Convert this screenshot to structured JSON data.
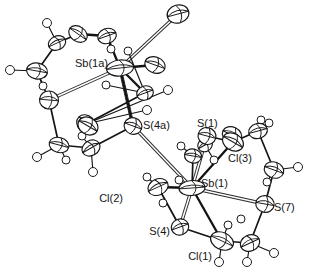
{
  "figure": {
    "kind": "ortep-thermal-ellipsoid-plot",
    "background_color": "#ffffff",
    "line_color": "#141414",
    "label_color": "#151515",
    "width": 312,
    "height": 279
  },
  "labels": [
    {
      "id": "sb1a",
      "text": "Sb(1a)",
      "x": 75,
      "y": 67,
      "anchor": "start"
    },
    {
      "id": "s4a",
      "text": "S(4a)",
      "x": 143,
      "y": 129,
      "anchor": "start"
    },
    {
      "id": "s1",
      "text": "S(1)",
      "x": 197,
      "y": 127,
      "anchor": "start"
    },
    {
      "id": "cl3",
      "text": "Cl(3)",
      "x": 228,
      "y": 162,
      "anchor": "start"
    },
    {
      "id": "sb1",
      "text": "Sb(1)",
      "x": 201,
      "y": 187,
      "anchor": "start"
    },
    {
      "id": "s7",
      "text": "S(7)",
      "x": 274,
      "y": 211,
      "anchor": "start"
    },
    {
      "id": "cl2",
      "text": "Cl(2)",
      "x": 123,
      "y": 202,
      "anchor": "end"
    },
    {
      "id": "s4",
      "text": "S(4)",
      "x": 170,
      "y": 235,
      "anchor": "end"
    },
    {
      "id": "cl1",
      "text": "Cl(1)",
      "x": 212,
      "y": 260,
      "anchor": "end"
    }
  ],
  "atoms": {
    "heavy": [
      {
        "id": "Sb1a",
        "element": "Sb",
        "x": 120,
        "y": 68,
        "rx": 13.5,
        "ry": 8.0,
        "rot": -6,
        "style": "ellipsoid"
      },
      {
        "id": "Sb1",
        "element": "Sb",
        "x": 192,
        "y": 188,
        "rx": 13.0,
        "ry": 7.5,
        "rot": -4,
        "style": "ellipsoid"
      },
      {
        "id": "S4a",
        "element": "S",
        "x": 133,
        "y": 126,
        "rx": 9.0,
        "ry": 8.2,
        "rot": 20,
        "style": "ellipsoid"
      },
      {
        "id": "S1",
        "element": "S",
        "x": 207,
        "y": 136,
        "rx": 9.0,
        "ry": 8.4,
        "rot": 15,
        "style": "ellipsoid"
      },
      {
        "id": "S7",
        "element": "S",
        "x": 265,
        "y": 204,
        "rx": 9.2,
        "ry": 8.4,
        "rot": 10,
        "style": "ellipsoid"
      },
      {
        "id": "S4",
        "element": "S",
        "x": 180,
        "y": 227,
        "rx": 8.8,
        "ry": 8.0,
        "rot": -20,
        "style": "ellipsoid"
      },
      {
        "id": "S4b",
        "element": "S",
        "x": 49,
        "y": 100,
        "rx": 9.5,
        "ry": 9.0,
        "rot": 5,
        "style": "ellipsoid"
      },
      {
        "id": "Cl1",
        "element": "Cl",
        "x": 222,
        "y": 241,
        "rx": 12.0,
        "ry": 8.5,
        "rot": 25,
        "style": "ellipsoid"
      },
      {
        "id": "Cl2",
        "element": "Cl",
        "x": 158,
        "y": 187,
        "rx": 10.5,
        "ry": 8.0,
        "rot": -25,
        "style": "ellipsoid"
      },
      {
        "id": "Cl3",
        "element": "Cl",
        "x": 233,
        "y": 142,
        "rx": 11.0,
        "ry": 8.5,
        "rot": 30,
        "style": "ellipsoid"
      },
      {
        "id": "Cl1a",
        "element": "Cl",
        "x": 178,
        "y": 14,
        "rx": 11.0,
        "ry": 9.0,
        "rot": -15,
        "style": "ellipsoid"
      },
      {
        "id": "Cl3a",
        "element": "Cl",
        "x": 155,
        "y": 65,
        "rx": 10.5,
        "ry": 8.0,
        "rot": 20,
        "style": "ellipsoid"
      },
      {
        "id": "Cl2a",
        "element": "Cl",
        "x": 88,
        "y": 126,
        "rx": 10.5,
        "ry": 8.5,
        "rot": 30,
        "style": "ellipsoid"
      }
    ],
    "carbon": [
      {
        "id": "C1a",
        "x": 78,
        "y": 34,
        "rx": 10.0,
        "ry": 7.5,
        "rot": 35
      },
      {
        "id": "C2a",
        "x": 57,
        "y": 43,
        "rx": 9.0,
        "ry": 7.0,
        "rot": -25
      },
      {
        "id": "C3a",
        "x": 37,
        "y": 71,
        "rx": 10.5,
        "ry": 8.0,
        "rot": 10
      },
      {
        "id": "C4a",
        "x": 107,
        "y": 36,
        "rx": 9.5,
        "ry": 7.5,
        "rot": -20
      },
      {
        "id": "C5a",
        "x": 59,
        "y": 145,
        "rx": 10.0,
        "ry": 7.5,
        "rot": 15
      },
      {
        "id": "C6a",
        "x": 91,
        "y": 148,
        "rx": 9.5,
        "ry": 7.5,
        "rot": -30
      },
      {
        "id": "C7a",
        "x": 86,
        "y": 124,
        "rx": 10.0,
        "ry": 8.5,
        "rot": 45
      },
      {
        "id": "C8a",
        "x": 145,
        "y": 93,
        "rx": 8.5,
        "ry": 7.0,
        "rot": -20
      },
      {
        "id": "C1",
        "x": 232,
        "y": 135,
        "rx": 10.0,
        "ry": 8.0,
        "rot": 25
      },
      {
        "id": "C2",
        "x": 258,
        "y": 131,
        "rx": 9.5,
        "ry": 7.5,
        "rot": -15
      },
      {
        "id": "C3",
        "x": 274,
        "y": 170,
        "rx": 10.0,
        "ry": 8.0,
        "rot": 20
      },
      {
        "id": "C4",
        "x": 250,
        "y": 243,
        "rx": 10.0,
        "ry": 8.0,
        "rot": -25
      },
      {
        "id": "C5",
        "x": 193,
        "y": 156,
        "rx": 8.5,
        "ry": 7.0,
        "rot": 10
      },
      {
        "id": "C6",
        "x": 205,
        "y": 145,
        "rx": 7.5,
        "ry": 6.5,
        "rot": -30
      }
    ],
    "hydrogen": [
      {
        "id": "H1",
        "x": 47,
        "y": 23,
        "r": 4.5
      },
      {
        "id": "H2",
        "x": 10,
        "y": 70,
        "r": 4.5
      },
      {
        "id": "H3",
        "x": 43,
        "y": 86,
        "r": 4.0
      },
      {
        "id": "H4",
        "x": 111,
        "y": 49,
        "r": 4.0
      },
      {
        "id": "H5",
        "x": 128,
        "y": 51,
        "r": 4.0
      },
      {
        "id": "H6",
        "x": 106,
        "y": 85,
        "r": 4.0
      },
      {
        "id": "H7",
        "x": 168,
        "y": 90,
        "r": 4.5
      },
      {
        "id": "H8",
        "x": 147,
        "y": 110,
        "r": 4.5
      },
      {
        "id": "H9",
        "x": 37,
        "y": 157,
        "r": 4.5
      },
      {
        "id": "H10",
        "x": 66,
        "y": 160,
        "r": 4.0
      },
      {
        "id": "H11",
        "x": 93,
        "y": 172,
        "r": 4.5
      },
      {
        "id": "H12",
        "x": 82,
        "y": 136,
        "r": 4.0
      },
      {
        "id": "H13",
        "x": 181,
        "y": 146,
        "r": 4.0
      },
      {
        "id": "H14",
        "x": 179,
        "y": 180,
        "r": 4.0
      },
      {
        "id": "H15",
        "x": 163,
        "y": 203,
        "r": 4.0
      },
      {
        "id": "H16",
        "x": 147,
        "y": 177,
        "r": 4.0
      },
      {
        "id": "H17",
        "x": 261,
        "y": 120,
        "r": 4.0
      },
      {
        "id": "H18",
        "x": 269,
        "y": 123,
        "r": 4.0
      },
      {
        "id": "H19",
        "x": 298,
        "y": 167,
        "r": 4.5
      },
      {
        "id": "H20",
        "x": 267,
        "y": 182,
        "r": 4.0
      },
      {
        "id": "H21",
        "x": 228,
        "y": 225,
        "r": 4.0
      },
      {
        "id": "H22",
        "x": 219,
        "y": 262,
        "r": 4.5
      },
      {
        "id": "H23",
        "x": 247,
        "y": 262,
        "r": 4.5
      },
      {
        "id": "H24",
        "x": 274,
        "y": 253,
        "r": 4.5
      },
      {
        "id": "H25",
        "x": 241,
        "y": 219,
        "r": 4.0
      },
      {
        "id": "H26",
        "x": 214,
        "y": 160,
        "r": 4.0
      }
    ]
  },
  "bonds": {
    "solid": [
      {
        "from": "Sb1a",
        "to": "Cl3a",
        "weight": "strong"
      },
      {
        "from": "Sb1a",
        "to": "C8a",
        "weight": "strong"
      },
      {
        "from": "Sb1a",
        "to": "S4a",
        "weight": "strong"
      },
      {
        "from": "Sb1a",
        "to": "C4a",
        "weight": "strong"
      },
      {
        "from": "C4a",
        "to": "C1a",
        "weight": "strong"
      },
      {
        "from": "C1a",
        "to": "C2a",
        "weight": "med"
      },
      {
        "from": "C2a",
        "to": "C3a",
        "weight": "med"
      },
      {
        "from": "C3a",
        "to": "S4b",
        "weight": "med"
      },
      {
        "from": "S4b",
        "to": "C5a",
        "weight": "med"
      },
      {
        "from": "C5a",
        "to": "C6a",
        "weight": "med"
      },
      {
        "from": "C6a",
        "to": "S4a",
        "weight": "med"
      },
      {
        "from": "C8a",
        "to": "C7a",
        "weight": "med"
      },
      {
        "from": "Sb1",
        "to": "Cl2",
        "weight": "strong"
      },
      {
        "from": "Sb1",
        "to": "Cl3",
        "weight": "strong"
      },
      {
        "from": "Sb1",
        "to": "Cl1",
        "weight": "strong"
      },
      {
        "from": "Sb1",
        "to": "C5",
        "weight": "med"
      },
      {
        "from": "S1",
        "to": "Cl3",
        "weight": "med"
      },
      {
        "from": "Cl3",
        "to": "C2",
        "weight": "med"
      },
      {
        "from": "C2",
        "to": "C3",
        "weight": "med"
      },
      {
        "from": "C3",
        "to": "S7",
        "weight": "med"
      },
      {
        "from": "S7",
        "to": "C4",
        "weight": "med"
      },
      {
        "from": "C4",
        "to": "Cl1",
        "weight": "med"
      },
      {
        "from": "Cl2",
        "to": "S4",
        "weight": "med"
      },
      {
        "from": "S4",
        "to": "Cl1",
        "weight": "med"
      }
    ],
    "open": [
      {
        "from": "Sb1a",
        "to": "Cl1a"
      },
      {
        "from": "Sb1a",
        "to": "S4b"
      },
      {
        "from": "Sb1a",
        "to": "S4a"
      },
      {
        "from": "S4a",
        "to": "Sb1"
      },
      {
        "from": "Sb1",
        "to": "S1"
      },
      {
        "from": "Sb1",
        "to": "S7"
      },
      {
        "from": "Sb1",
        "to": "S4"
      }
    ],
    "hydrogen_links": [
      {
        "from": "C2a",
        "to": "H1"
      },
      {
        "from": "C3a",
        "to": "H2"
      },
      {
        "from": "C3a",
        "to": "H3"
      },
      {
        "from": "C4a",
        "to": "H4"
      },
      {
        "from": "C8a",
        "to": "H5"
      },
      {
        "from": "C8a",
        "to": "H6"
      },
      {
        "from": "C7a",
        "to": "H7"
      },
      {
        "from": "C7a",
        "to": "H8"
      },
      {
        "from": "C5a",
        "to": "H9"
      },
      {
        "from": "C5a",
        "to": "H10"
      },
      {
        "from": "C6a",
        "to": "H11"
      },
      {
        "from": "C6a",
        "to": "H12"
      },
      {
        "from": "C5",
        "to": "H13"
      },
      {
        "from": "Cl2",
        "to": "H16"
      },
      {
        "from": "C2",
        "to": "H17"
      },
      {
        "from": "C2",
        "to": "H18"
      },
      {
        "from": "C3",
        "to": "H19"
      },
      {
        "from": "C3",
        "to": "H20"
      },
      {
        "from": "C4",
        "to": "H23"
      },
      {
        "from": "C4",
        "to": "H24"
      },
      {
        "from": "Cl1",
        "to": "H22"
      },
      {
        "from": "Cl1",
        "to": "H21"
      },
      {
        "from": "C6",
        "to": "H26"
      }
    ]
  }
}
